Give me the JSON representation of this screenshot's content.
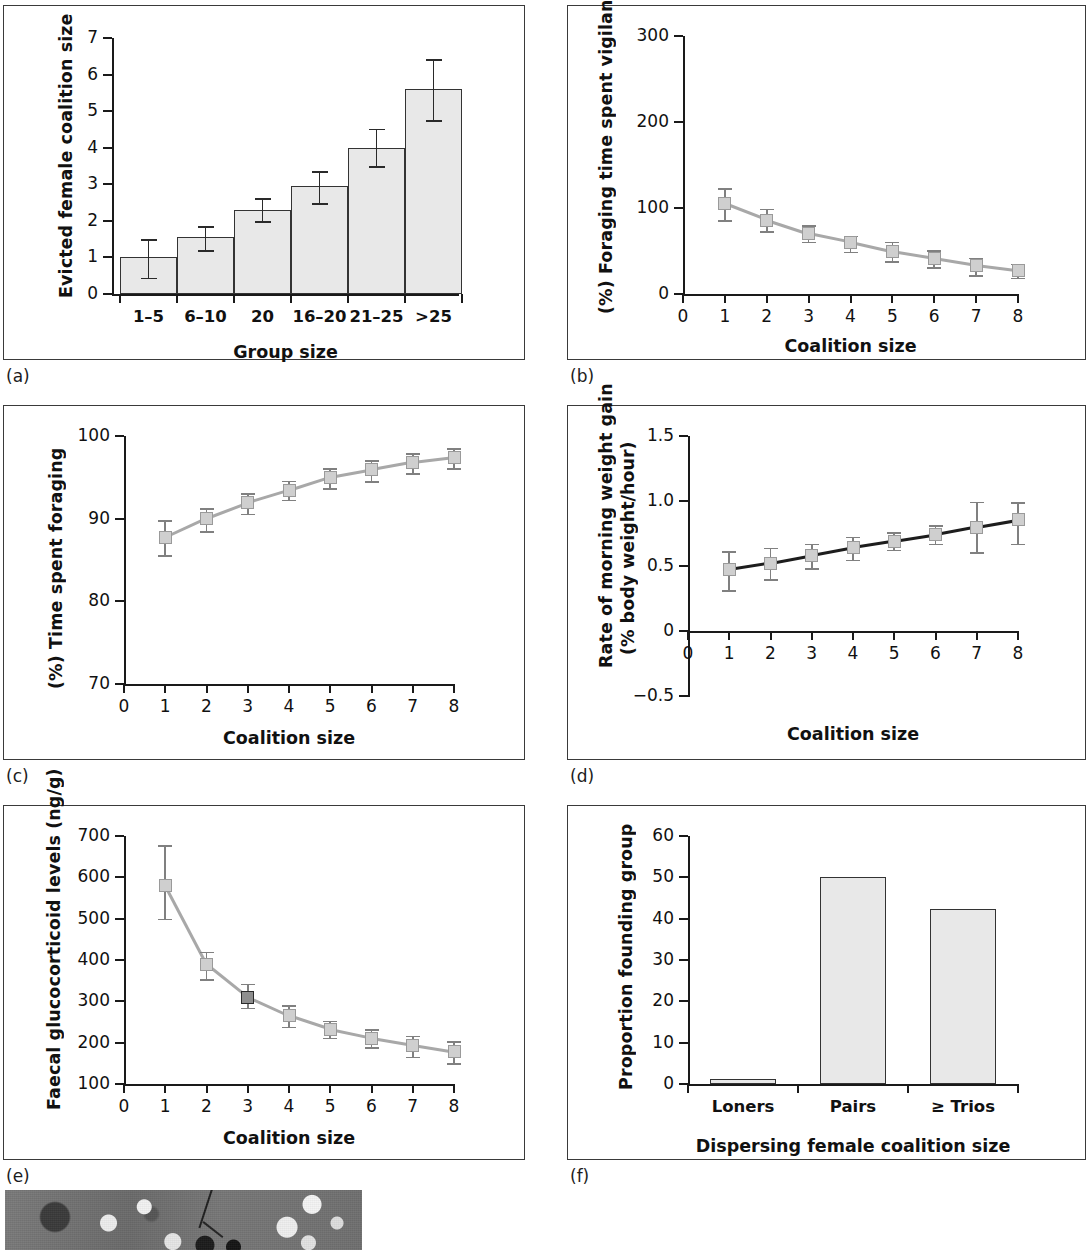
{
  "figure": {
    "panel_labels": [
      "(a)",
      "(b)",
      "(c)",
      "(d)",
      "(e)",
      "(f)"
    ],
    "photo_caption": ""
  },
  "chart_data": [
    {
      "panel": "(a)",
      "type": "bar",
      "title": "",
      "xlabel": "Group size",
      "ylabel": "Evicted female coalition size",
      "categories": [
        "1–5",
        "6–10",
        "20",
        "16–20",
        "21–25",
        ">25"
      ],
      "values": [
        1.0,
        1.55,
        2.3,
        2.95,
        4.0,
        5.6
      ],
      "err_low": [
        0.55,
        0.35,
        0.3,
        0.47,
        0.5,
        0.85
      ],
      "err_high": [
        0.5,
        0.3,
        0.33,
        0.42,
        0.52,
        0.83
      ],
      "yticks": [
        0,
        1,
        2,
        3,
        4,
        5,
        6,
        7
      ],
      "ylim": [
        0,
        7
      ],
      "grid": false,
      "legend": "none"
    },
    {
      "panel": "(b)",
      "type": "line",
      "title": "",
      "xlabel": "Coalition size",
      "ylabel": "(%) Foraging time spent vigilant",
      "x": [
        1,
        2,
        3,
        4,
        5,
        6,
        7,
        8
      ],
      "values": [
        105,
        86,
        70,
        60,
        49,
        41,
        33,
        27
      ],
      "err_low": [
        19,
        13,
        9,
        11,
        11,
        10,
        11,
        8
      ],
      "err_high": [
        18,
        13,
        10,
        8,
        12,
        10,
        9,
        8
      ],
      "yticks": [
        0,
        100,
        200,
        300
      ],
      "ylim": [
        0,
        300
      ],
      "xticks": [
        0,
        1,
        2,
        3,
        4,
        5,
        6,
        7,
        8
      ],
      "xlim": [
        0,
        8
      ],
      "grid": false,
      "legend": "none"
    },
    {
      "panel": "(c)",
      "type": "line",
      "title": "",
      "xlabel": "Coalition size",
      "ylabel": "(%) Time spent foraging",
      "x": [
        1,
        2,
        3,
        4,
        5,
        6,
        7,
        8
      ],
      "values": [
        87.7,
        90.0,
        91.9,
        93.4,
        95.0,
        95.9,
        96.8,
        97.4
      ],
      "err_low": [
        2.1,
        1.5,
        1.3,
        1.1,
        1.3,
        1.4,
        1.3,
        1.3
      ],
      "err_high": [
        2.1,
        1.3,
        1.2,
        1.2,
        1.1,
        1.2,
        1.1,
        1.1
      ],
      "yticks": [
        70,
        80,
        90,
        100
      ],
      "ylim": [
        70,
        100
      ],
      "xticks": [
        0,
        1,
        2,
        3,
        4,
        5,
        6,
        7,
        8
      ],
      "xlim": [
        0,
        8
      ],
      "grid": false,
      "legend": "none"
    },
    {
      "panel": "(d)",
      "type": "line",
      "title": "",
      "xlabel": "Coalition size",
      "ylabel": "Rate of morning weight gain",
      "ylabel2": "(% body weight/hour)",
      "x": [
        1,
        2,
        3,
        4,
        5,
        6,
        7,
        8
      ],
      "values": [
        0.47,
        0.52,
        0.58,
        0.64,
        0.69,
        0.74,
        0.8,
        0.855
      ],
      "err_low": [
        0.155,
        0.12,
        0.095,
        0.09,
        0.065,
        0.07,
        0.195,
        0.185
      ],
      "err_high": [
        0.145,
        0.12,
        0.09,
        0.085,
        0.07,
        0.075,
        0.195,
        0.135
      ],
      "yticks": [
        -0.5,
        0,
        0.5,
        1.0,
        1.5
      ],
      "ytick_labels": [
        "−0.5",
        "0",
        "0.5",
        "1.0",
        "1.5"
      ],
      "ylim": [
        -0.5,
        1.5
      ],
      "xticks": [
        0,
        1,
        2,
        3,
        4,
        5,
        6,
        7,
        8
      ],
      "xlim": [
        0,
        8
      ],
      "grid": false,
      "legend": "none"
    },
    {
      "panel": "(e)",
      "type": "line",
      "title": "",
      "xlabel": "Coalition size",
      "ylabel": "Faecal glucocorticoid levels (ng/g)",
      "x": [
        1,
        2,
        3,
        4,
        5,
        6,
        7,
        8
      ],
      "values": [
        580,
        390,
        310,
        265,
        232,
        211,
        194,
        178
      ],
      "err_low": [
        80,
        37,
        25,
        26,
        20,
        22,
        28,
        28
      ],
      "err_high": [
        98,
        30,
        33,
        25,
        21,
        22,
        23,
        25
      ],
      "highlight_index": 2,
      "yticks": [
        100,
        200,
        300,
        400,
        500,
        600,
        700
      ],
      "ylim": [
        100,
        700
      ],
      "xticks": [
        0,
        1,
        2,
        3,
        4,
        5,
        6,
        7,
        8
      ],
      "xlim": [
        0,
        8
      ],
      "grid": false,
      "legend": "none"
    },
    {
      "panel": "(f)",
      "type": "bar",
      "title": "",
      "xlabel": "Dispersing female coalition size",
      "ylabel": "Proportion founding group",
      "categories": [
        "Loners",
        "Pairs",
        "≥ Trios"
      ],
      "values": [
        1.1,
        50.0,
        42.3
      ],
      "yticks": [
        0,
        10,
        20,
        30,
        40,
        50,
        60
      ],
      "ylim": [
        0,
        60
      ],
      "grid": false,
      "legend": "none"
    }
  ]
}
